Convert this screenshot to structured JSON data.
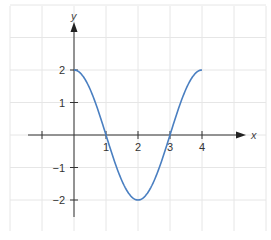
{
  "chart_data": {
    "type": "line",
    "title": "",
    "xlabel": "x",
    "ylabel": "y",
    "xlim": [
      -2,
      5
    ],
    "ylim": [
      -2.8,
      4
    ],
    "grid": true,
    "legend": null,
    "x_ticks": [
      {
        "value": 1,
        "label": "1"
      },
      {
        "value": 2,
        "label": "2"
      },
      {
        "value": 3,
        "label": "3"
      },
      {
        "value": 4,
        "label": "4"
      }
    ],
    "x_unlabeled_ticks": [
      -1
    ],
    "y_ticks": [
      {
        "value": 2,
        "label": "2"
      },
      {
        "value": 1,
        "label": "1"
      },
      {
        "value": -1,
        "label": "−1"
      },
      {
        "value": -2,
        "label": "−2"
      }
    ],
    "series": [
      {
        "name": "y = 2cos(πx/2)",
        "color": "#4a7fc1",
        "x": [
          0,
          0.5,
          1,
          1.5,
          2,
          2.5,
          3,
          3.5,
          4
        ],
        "y": [
          2,
          1.414,
          0,
          -1.414,
          -2,
          -1.414,
          0,
          1.414,
          2
        ]
      }
    ]
  },
  "colors": {
    "grid": "#e6e6e6",
    "axis": "#333333",
    "curve": "#4a7fc1"
  }
}
